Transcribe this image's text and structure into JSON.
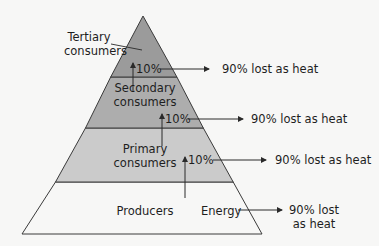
{
  "diagram": {
    "colors": {
      "background": "#f7f7f6",
      "tertiary": "#9b9b9b",
      "secondary": "#adadad",
      "primary": "#cbcbcb",
      "producers": "#f7f7f6",
      "line": "#3a3a3a"
    },
    "levels": [
      {
        "name": "Tertiary",
        "line1": "Tertiary",
        "line2": "consumers"
      },
      {
        "name": "Secondary",
        "line1": "Secondary",
        "line2": "consumers"
      },
      {
        "name": "Primary",
        "line1": "Primary",
        "line2": "consumers"
      },
      {
        "name": "Producers",
        "line1": "Producers"
      }
    ],
    "transfers": [
      {
        "percent": "10%",
        "loss": "90% lost as heat"
      },
      {
        "percent": "10%",
        "loss": "90% lost as heat"
      },
      {
        "percent": "10%",
        "loss": "90% lost as heat"
      }
    ],
    "energy": {
      "label": "Energy",
      "loss_line1": "90% lost",
      "loss_line2": "as heat"
    }
  }
}
